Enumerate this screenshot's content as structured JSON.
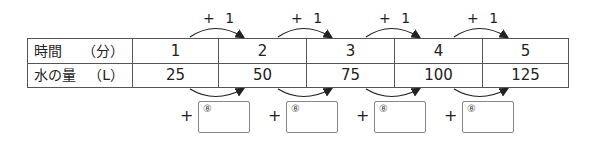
{
  "table": {
    "rows": [
      {
        "label": "時間",
        "unit": "（分）",
        "values": [
          "1",
          "2",
          "3",
          "4",
          "5"
        ]
      },
      {
        "label": "水の量",
        "unit": "（L）",
        "values": [
          "25",
          "50",
          "75",
          "100",
          "125"
        ]
      }
    ]
  },
  "top_arrows": [
    {
      "label": "+ 1"
    },
    {
      "label": "+ 1"
    },
    {
      "label": "+ 1"
    },
    {
      "label": "+ 1"
    }
  ],
  "bottom_answers": [
    {
      "plus": "+",
      "mark": "⑧",
      "value": ""
    },
    {
      "plus": "+",
      "mark": "⑧",
      "value": ""
    },
    {
      "plus": "+",
      "mark": "⑧",
      "value": ""
    },
    {
      "plus": "+",
      "mark": "⑧",
      "value": ""
    }
  ]
}
